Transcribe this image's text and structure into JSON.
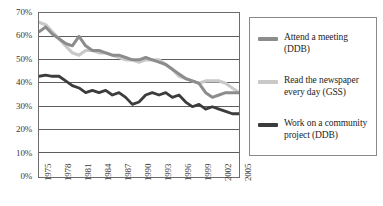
{
  "chart_data": {
    "type": "line",
    "title": "",
    "xlabel": "",
    "ylabel": "",
    "ylim": [
      0,
      70
    ],
    "ytick_labels": [
      "70%",
      "60%",
      "50%",
      "40%",
      "30%",
      "20%",
      "10%",
      "0%"
    ],
    "ytick_values": [
      70,
      60,
      50,
      40,
      30,
      20,
      10,
      0
    ],
    "grid": true,
    "legend_position": "right",
    "xtick_labels": [
      "1975",
      "1978",
      "1981",
      "1984",
      "1987",
      "1990",
      "1993",
      "1996",
      "1999",
      "2002",
      "2005"
    ],
    "xlim": [
      1975,
      2005
    ],
    "x": [
      1975,
      1976,
      1977,
      1978,
      1979,
      1980,
      1981,
      1982,
      1983,
      1984,
      1985,
      1986,
      1987,
      1988,
      1989,
      1990,
      1991,
      1992,
      1993,
      1994,
      1995,
      1996,
      1997,
      1998,
      1999,
      2000,
      2001,
      2002,
      2003,
      2004,
      2005
    ],
    "series": [
      {
        "name": "Attend a meeting (DDB)",
        "color": "#8c8c8c",
        "values": [
          62,
          64,
          61,
          59,
          57,
          56,
          60,
          56,
          54,
          54,
          53,
          52,
          52,
          51,
          50,
          50,
          51,
          50,
          49,
          48,
          46,
          44,
          42,
          41,
          40,
          36,
          34,
          35,
          36,
          36,
          36
        ]
      },
      {
        "name": "Read the newspaper every day (GSS)",
        "color": "#c9c9c9",
        "values": [
          66,
          65,
          62,
          59,
          56,
          53,
          52,
          54,
          54,
          53,
          53,
          52,
          51,
          50,
          50,
          49,
          50,
          50,
          50,
          48,
          46,
          43,
          42,
          41,
          40,
          41,
          41,
          41,
          40,
          38,
          36
        ]
      },
      {
        "name": "Work on a community project (DDB)",
        "color": "#3c3c3c",
        "values": [
          43,
          43.5,
          43,
          43,
          41,
          39,
          38,
          36,
          37,
          36,
          37,
          35,
          36,
          34,
          31,
          32,
          35,
          36,
          35,
          36,
          34,
          35,
          32,
          30,
          31,
          29,
          30,
          29,
          28,
          27,
          27
        ]
      }
    ]
  },
  "legend": {
    "entries": [
      {
        "label_line1": "Attend a meeting",
        "label_line2": "(DDB)",
        "color": "#8c8c8c"
      },
      {
        "label_line1": "Read the newspaper",
        "label_line2": "every day (GSS)",
        "color": "#c9c9c9"
      },
      {
        "label_line1": "Work on a community",
        "label_line2": "project (DDB)",
        "color": "#3c3c3c"
      }
    ]
  }
}
